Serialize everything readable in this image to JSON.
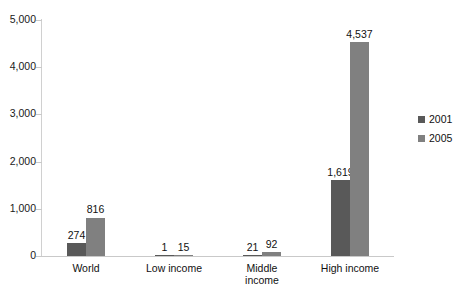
{
  "chart_data": {
    "type": "bar",
    "title": "",
    "subtitle": "",
    "xlabel": "",
    "ylabel": "",
    "categories": [
      "World",
      "Low income",
      "Middle\nincome",
      "High income"
    ],
    "series": [
      {
        "name": "2001",
        "color": "#595959",
        "values": [
          274,
          1,
          21,
          1619
        ],
        "labels": [
          "274",
          "1",
          "21",
          "1,619"
        ]
      },
      {
        "name": "2005",
        "color": "#808080",
        "values": [
          816,
          15,
          92,
          4537
        ],
        "labels": [
          "816",
          "15",
          "92",
          "4,537"
        ]
      }
    ],
    "ylim": [
      0,
      5000
    ],
    "yticks": [
      0,
      1000,
      2000,
      3000,
      4000,
      5000
    ],
    "ytick_labels": [
      "0",
      "1,000",
      "2,000",
      "3,000",
      "4,000",
      "5,000"
    ],
    "grid": false,
    "legend_position": "right",
    "legend_entries": [
      "2001",
      "2005"
    ]
  }
}
